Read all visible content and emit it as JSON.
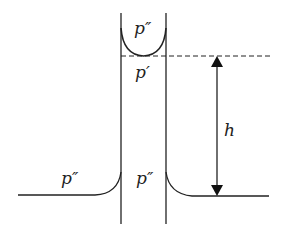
{
  "diagram": {
    "labels": {
      "p_double_prime_top": "p″",
      "p_prime": "p′",
      "h": "h",
      "p_double_prime_left": "p″",
      "p_double_prime_center": "p″"
    },
    "colors": {
      "stroke": "#222222",
      "background": "#ffffff"
    }
  }
}
